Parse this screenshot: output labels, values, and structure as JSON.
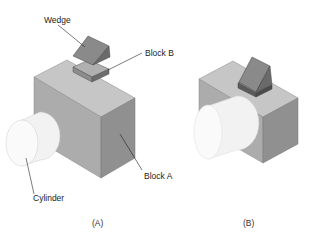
{
  "figure": {
    "panels": [
      {
        "caption": "(A)",
        "labels": {
          "wedge": "Wedge",
          "block_b": "Block B",
          "block_a": "Block A",
          "cylinder": "Cylinder"
        }
      },
      {
        "caption": "(B)"
      }
    ],
    "colors": {
      "block_top": "#c4c4c4",
      "block_front": "#a9a9a9",
      "block_side": "#8e8e8e",
      "wedge_face": "#8a8a8a",
      "wedge_side": "#6a6a6a",
      "cylinder": "#f4f4f4"
    }
  }
}
